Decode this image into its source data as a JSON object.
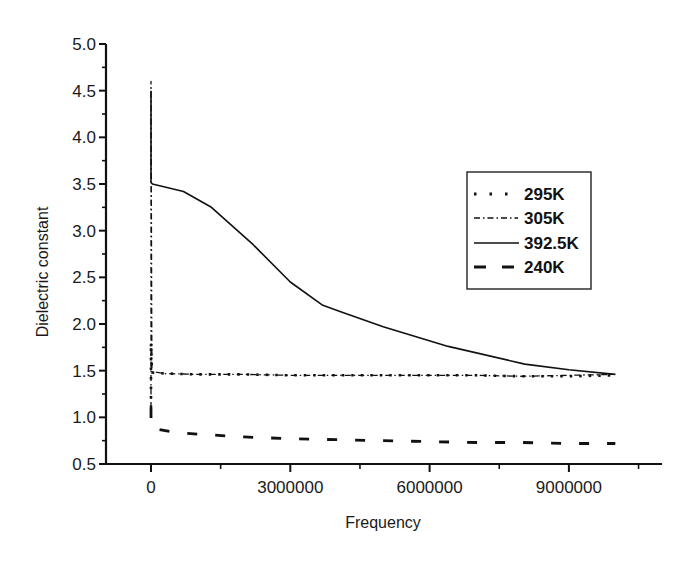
{
  "chart_data": {
    "type": "line",
    "title": "",
    "xlabel": "Frequency",
    "ylabel": "Dielectric constant",
    "xlim": [
      -1000000,
      11200000
    ],
    "ylim": [
      0.5,
      5.0
    ],
    "x_ticks": [
      0,
      3000000,
      6000000,
      9000000
    ],
    "x_tick_labels": [
      "0",
      "3000000",
      "6000000",
      "9000000"
    ],
    "y_ticks": [
      0.5,
      1.0,
      1.5,
      2.0,
      2.5,
      3.0,
      3.5,
      4.0,
      4.5,
      5.0
    ],
    "y_tick_labels": [
      "0.5",
      "1.0",
      "1.5",
      "2.0",
      "2.5",
      "3.0",
      "3.5",
      "4.0",
      "4.5",
      "5.0"
    ],
    "grid": false,
    "legend_position": "right-center (inside plot)",
    "series": [
      {
        "name": "295K",
        "style": "dotted",
        "x": [
          0,
          0,
          20000,
          300000,
          1000000,
          2000000,
          3000000,
          4000000,
          5000000,
          6000000,
          7000000,
          8000000,
          9000000,
          10000000
        ],
        "y": [
          1.1,
          1.8,
          1.48,
          1.47,
          1.46,
          1.46,
          1.45,
          1.45,
          1.45,
          1.45,
          1.45,
          1.44,
          1.44,
          1.45
        ]
      },
      {
        "name": "305K",
        "style": "dash-dot",
        "x": [
          0,
          0,
          20000,
          300000,
          1000000,
          2000000,
          3000000,
          4000000,
          5000000,
          6000000,
          7000000,
          8000000,
          9000000,
          10000000
        ],
        "y": [
          1.1,
          4.6,
          1.49,
          1.47,
          1.46,
          1.46,
          1.45,
          1.45,
          1.45,
          1.45,
          1.45,
          1.44,
          1.45,
          1.46
        ]
      },
      {
        "name": "392.5K",
        "style": "solid",
        "x": [
          0,
          0,
          30000,
          700000,
          1300000,
          2200000,
          3000000,
          3700000,
          4100000,
          5000000,
          6400000,
          8050000,
          9000000,
          10000000
        ],
        "y": [
          4.5,
          3.52,
          3.5,
          3.42,
          3.25,
          2.85,
          2.45,
          2.2,
          2.13,
          1.97,
          1.76,
          1.57,
          1.51,
          1.46
        ]
      },
      {
        "name": "240K",
        "style": "dashed",
        "x": [
          0,
          0,
          30000,
          500000,
          1000000,
          2000000,
          3000000,
          4000000,
          5000000,
          6000000,
          7000000,
          8000000,
          9000000,
          10000000
        ],
        "y": [
          1.1,
          0.92,
          0.88,
          0.84,
          0.82,
          0.79,
          0.77,
          0.76,
          0.75,
          0.74,
          0.73,
          0.73,
          0.72,
          0.72
        ]
      }
    ],
    "legend": [
      {
        "label": "295K",
        "style": "dotted"
      },
      {
        "label": "305K",
        "style": "dash-dot"
      },
      {
        "label": "392.5K",
        "style": "solid"
      },
      {
        "label": "240K",
        "style": "dashed"
      }
    ],
    "line_color": "#111111"
  },
  "axes": {
    "x_title": "Frequency",
    "y_title": "Dielectric constant"
  },
  "legend_items": [
    {
      "label": "295K"
    },
    {
      "label": "305K"
    },
    {
      "label": "392.5K"
    },
    {
      "label": "240K"
    }
  ]
}
